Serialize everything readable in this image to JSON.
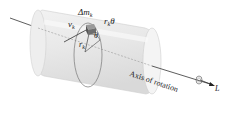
{
  "diagram": {
    "labels": {
      "mass_element": {
        "main": "Δm",
        "sub": "k"
      },
      "velocity": {
        "main": "v",
        "sub": "k"
      },
      "arc_length": {
        "main": "r",
        "sub": "k",
        "suffix": "θ"
      },
      "radius": {
        "main": "r",
        "sub": "k"
      },
      "angle": "θ",
      "axis": "Axis of rotation",
      "angular_momentum": "L"
    },
    "colors": {
      "cylinder_fill": "#e6e6e6",
      "cylinder_edge": "#c8c8c8",
      "axis_line": "#333333",
      "mass_block": "#6e6e6e",
      "text": "#222222"
    }
  }
}
